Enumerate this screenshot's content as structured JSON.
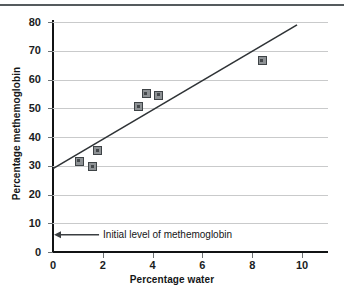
{
  "figure": {
    "has_top_rule": true,
    "background_color": "#ffffff"
  },
  "chart_data": {
    "type": "scatter",
    "title": "",
    "subtitle": "",
    "xlabel": "Percentage water",
    "ylabel": "Percentage methemoglobin",
    "xlim": [
      0,
      11
    ],
    "ylim": [
      0,
      80
    ],
    "xticks": [
      0,
      2,
      4,
      6,
      8,
      10
    ],
    "xtick_labels": [
      "0",
      "2",
      "4",
      "6",
      "8",
      "10"
    ],
    "yticks": [
      0,
      10,
      20,
      30,
      40,
      50,
      60,
      70,
      80
    ],
    "ytick_labels": [
      "0",
      "10",
      "20",
      "30",
      "40",
      "50",
      "60",
      "70",
      "80"
    ],
    "grid": "horizontal",
    "grid_color": "#c9cacb",
    "legend": "none",
    "marker_style": "square",
    "marker_face_color": "#8e9295",
    "marker_edge_color": "#3e4346",
    "series": [
      {
        "name": "Methemoglobin vs water",
        "points": [
          {
            "x": 1.05,
            "y": 31.5
          },
          {
            "x": 1.6,
            "y": 29.7
          },
          {
            "x": 1.8,
            "y": 35.3
          },
          {
            "x": 3.45,
            "y": 50.5
          },
          {
            "x": 3.75,
            "y": 55.0
          },
          {
            "x": 4.25,
            "y": 54.5
          },
          {
            "x": 8.4,
            "y": 66.5
          }
        ]
      }
    ],
    "trendline": {
      "type": "line",
      "color": "#2f3336",
      "x_start": 0,
      "y_start": 29.0,
      "x_end": 9.8,
      "y_end": 79.0
    },
    "annotations": [
      {
        "text": "Initial level of methemoglobin",
        "arrow_from_x": 1.85,
        "arrow_to_x": 0.0,
        "y": 6.0,
        "arrow_color": "#3a3e41"
      }
    ]
  }
}
